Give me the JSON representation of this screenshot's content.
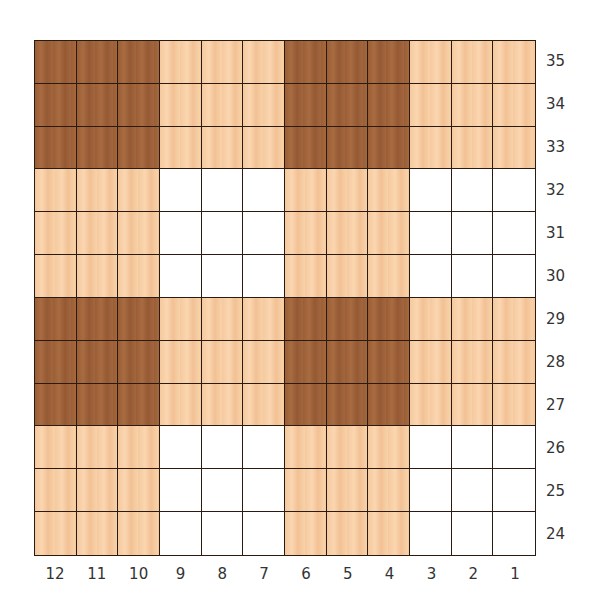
{
  "chart_data": {
    "type": "heatmap",
    "title": "",
    "columns": [
      12,
      11,
      10,
      9,
      8,
      7,
      6,
      5,
      4,
      3,
      2,
      1
    ],
    "rows": [
      35,
      34,
      33,
      32,
      31,
      30,
      29,
      28,
      27,
      26,
      25,
      24
    ],
    "legend": {
      "D": "dark brown",
      "L": "light peach",
      "W": "white"
    },
    "colors": {
      "D": "#9e6139",
      "L": "#f6cca3",
      "W": "#ffffff",
      "grid": "#2a1a10"
    },
    "grid": [
      [
        "D",
        "D",
        "D",
        "L",
        "L",
        "L",
        "D",
        "D",
        "D",
        "L",
        "L",
        "L"
      ],
      [
        "D",
        "D",
        "D",
        "L",
        "L",
        "L",
        "D",
        "D",
        "D",
        "L",
        "L",
        "L"
      ],
      [
        "D",
        "D",
        "D",
        "L",
        "L",
        "L",
        "D",
        "D",
        "D",
        "L",
        "L",
        "L"
      ],
      [
        "L",
        "L",
        "L",
        "W",
        "W",
        "W",
        "L",
        "L",
        "L",
        "W",
        "W",
        "W"
      ],
      [
        "L",
        "L",
        "L",
        "W",
        "W",
        "W",
        "L",
        "L",
        "L",
        "W",
        "W",
        "W"
      ],
      [
        "L",
        "L",
        "L",
        "W",
        "W",
        "W",
        "L",
        "L",
        "L",
        "W",
        "W",
        "W"
      ],
      [
        "D",
        "D",
        "D",
        "L",
        "L",
        "L",
        "D",
        "D",
        "D",
        "L",
        "L",
        "L"
      ],
      [
        "D",
        "D",
        "D",
        "L",
        "L",
        "L",
        "D",
        "D",
        "D",
        "L",
        "L",
        "L"
      ],
      [
        "D",
        "D",
        "D",
        "L",
        "L",
        "L",
        "D",
        "D",
        "D",
        "L",
        "L",
        "L"
      ],
      [
        "L",
        "L",
        "L",
        "W",
        "W",
        "W",
        "L",
        "L",
        "L",
        "W",
        "W",
        "W"
      ],
      [
        "L",
        "L",
        "L",
        "W",
        "W",
        "W",
        "L",
        "L",
        "L",
        "W",
        "W",
        "W"
      ],
      [
        "L",
        "L",
        "L",
        "W",
        "W",
        "W",
        "L",
        "L",
        "L",
        "W",
        "W",
        "W"
      ]
    ]
  },
  "labels": {
    "rows": [
      "35",
      "34",
      "33",
      "32",
      "31",
      "30",
      "29",
      "28",
      "27",
      "26",
      "25",
      "24"
    ],
    "cols": [
      "12",
      "11",
      "10",
      "9",
      "8",
      "7",
      "6",
      "5",
      "4",
      "3",
      "2",
      "1"
    ]
  }
}
